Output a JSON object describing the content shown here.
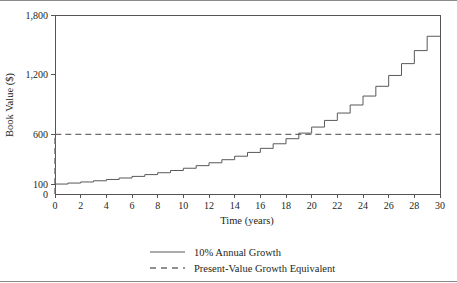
{
  "chart_data": {
    "type": "line",
    "subtype": "step-post",
    "title": "",
    "xlabel": "Time (years)",
    "ylabel": "Book Value ($)",
    "xlim": [
      0,
      30
    ],
    "ylim": [
      0,
      1800
    ],
    "grid": false,
    "xticks": [
      0,
      2,
      4,
      6,
      8,
      10,
      12,
      14,
      16,
      18,
      20,
      22,
      24,
      26,
      28,
      30
    ],
    "xticklabels": [
      "0",
      "2",
      "4",
      "6",
      "8",
      "10",
      "12",
      "14",
      "16",
      "18",
      "20",
      "22",
      "24",
      "26",
      "28",
      "30"
    ],
    "yticks": [
      0,
      100,
      600,
      1200,
      1800
    ],
    "yticklabels": [
      "0",
      "100",
      "600",
      "1,200",
      "1,800"
    ],
    "legend_position": "below",
    "series": [
      {
        "name": "10% Annual Growth",
        "style": "solid",
        "color": "#5a585a",
        "x": [
          0,
          1,
          2,
          3,
          4,
          5,
          6,
          7,
          8,
          9,
          10,
          11,
          12,
          13,
          14,
          15,
          16,
          17,
          18,
          19,
          20,
          21,
          22,
          23,
          24,
          25,
          26,
          27,
          28,
          29,
          30
        ],
        "values": [
          100,
          110,
          121,
          133,
          146,
          161,
          177,
          195,
          214,
          236,
          259,
          285,
          314,
          345,
          380,
          418,
          459,
          505,
          556,
          612,
          673,
          740,
          814,
          895,
          985,
          1083,
          1192,
          1311,
          1442,
          1586,
          1586
        ]
      },
      {
        "name": "Present-Value Growth Equivalent",
        "style": "dashed",
        "color": "#6e6c6e",
        "x": [
          0,
          0,
          30
        ],
        "values": [
          0,
          600,
          600
        ]
      }
    ],
    "annotations": [
      "Crossover of step curve above the 600 reference line occurs near year 19-20"
    ]
  },
  "legend": {
    "items": [
      {
        "label": "10% Annual Growth",
        "style": "solid"
      },
      {
        "label": "Present-Value Growth Equivalent",
        "style": "dashed"
      }
    ]
  },
  "colors": {
    "line": "#5a585a",
    "dashed": "#6e6c6e",
    "axis": "#555355",
    "rule": "#8a8a8a",
    "text": "#231f20",
    "background": "#ffffff"
  }
}
